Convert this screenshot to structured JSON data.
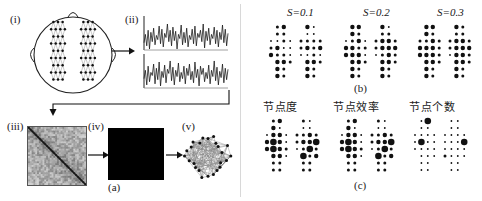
{
  "figure": {
    "panels": [
      {
        "id": "a",
        "label": "(a)"
      },
      {
        "id": "b",
        "label": "(b)"
      },
      {
        "id": "c",
        "label": "(c)"
      }
    ]
  },
  "panel_a": {
    "label": "(a)",
    "steps": [
      {
        "id": "i",
        "label": "(i)",
        "name": "electrode-montage-head"
      },
      {
        "id": "ii",
        "label": "(ii)",
        "name": "eeg-time-series"
      },
      {
        "id": "iii",
        "label": "(iii)",
        "name": "correlation-matrix"
      },
      {
        "id": "iv",
        "label": "(iv)",
        "name": "binary-adjacency-matrix"
      },
      {
        "id": "v",
        "label": "(v)",
        "name": "brain-network-graph"
      }
    ],
    "head": {
      "electrode_count_per_hemisphere": 31,
      "hemispheres": [
        "left",
        "right"
      ]
    },
    "time_series": {
      "trace_count": 2,
      "traces": [
        {
          "name": "channel-trace-1",
          "points": [
            42,
            58,
            36,
            66,
            30,
            62,
            44,
            70,
            38,
            56,
            48,
            74,
            40,
            68,
            34,
            60,
            52,
            78,
            44,
            66,
            36,
            72,
            46,
            64,
            30,
            58,
            50,
            76,
            38,
            62,
            42,
            70,
            34,
            56,
            48,
            68,
            40,
            74,
            36,
            60,
            52,
            66,
            44,
            78,
            32,
            64,
            46,
            70,
            38,
            58,
            50,
            72,
            40,
            66,
            34,
            62,
            48,
            76,
            42,
            68,
            36,
            60
          ]
        },
        {
          "name": "channel-trace-2",
          "points": [
            46,
            62,
            34,
            70,
            40,
            58,
            52,
            74,
            36,
            66,
            44,
            78,
            32,
            60,
            48,
            72,
            38,
            64,
            56,
            80,
            42,
            68,
            34,
            62,
            50,
            76,
            40,
            58,
            46,
            70,
            36,
            66,
            52,
            74,
            44,
            60,
            38,
            78,
            48,
            64,
            32,
            70,
            54,
            66,
            40,
            58,
            46,
            72,
            36,
            62,
            50,
            80,
            42,
            68,
            34,
            60,
            48,
            74,
            38,
            66,
            44,
            64
          ]
        }
      ]
    },
    "matrix": {
      "size": 32,
      "diagonal": "dark"
    },
    "network": {
      "node_count": 24,
      "edge_density": "dense"
    }
  },
  "panel_b": {
    "label": "(b)",
    "maps": [
      {
        "name": "sparsity-map-1",
        "title": "S=0.1",
        "sparsity": 0.1
      },
      {
        "name": "sparsity-map-2",
        "title": "S=0.2",
        "sparsity": 0.2
      },
      {
        "name": "sparsity-map-3",
        "title": "S=0.3",
        "sparsity": 0.3
      }
    ],
    "title_prefix": "S",
    "grid": {
      "rows": 8,
      "cols_per_lobe": 4,
      "lobes": 2
    }
  },
  "panel_c": {
    "label": "(c)",
    "maps": [
      {
        "name": "node-degree-map",
        "title": "节点度",
        "metric": "node degree"
      },
      {
        "name": "node-efficiency-map",
        "title": "节点效率",
        "metric": "node efficiency"
      },
      {
        "name": "node-count-map",
        "title": "节点个数",
        "metric": "node count"
      }
    ]
  },
  "dot_maps": {
    "b1": {
      "left": [
        [
          0,
          2,
          3,
          0
        ],
        [
          0,
          2,
          2,
          0
        ],
        [
          1,
          1,
          2,
          1
        ],
        [
          2,
          3,
          1,
          1
        ],
        [
          3,
          2,
          2,
          1
        ],
        [
          0,
          3,
          3,
          2
        ],
        [
          0,
          3,
          2,
          0
        ],
        [
          0,
          3,
          2,
          0
        ]
      ],
      "right": [
        [
          0,
          3,
          1,
          0
        ],
        [
          0,
          1,
          1,
          0
        ],
        [
          2,
          2,
          2,
          2
        ],
        [
          2,
          3,
          2,
          3
        ],
        [
          1,
          1,
          2,
          1
        ],
        [
          0,
          3,
          3,
          2
        ],
        [
          0,
          3,
          2,
          0
        ],
        [
          0,
          3,
          2,
          0
        ]
      ]
    },
    "b2": {
      "left": [
        [
          0,
          3,
          3,
          0
        ],
        [
          0,
          3,
          2,
          0
        ],
        [
          1,
          2,
          3,
          1
        ],
        [
          3,
          3,
          2,
          2
        ],
        [
          3,
          3,
          3,
          1
        ],
        [
          0,
          3,
          3,
          2
        ],
        [
          0,
          3,
          2,
          0
        ],
        [
          0,
          3,
          2,
          0
        ]
      ],
      "right": [
        [
          0,
          3,
          1,
          0
        ],
        [
          0,
          2,
          2,
          0
        ],
        [
          2,
          3,
          3,
          2
        ],
        [
          2,
          3,
          3,
          3
        ],
        [
          1,
          2,
          3,
          2
        ],
        [
          0,
          3,
          3,
          2
        ],
        [
          0,
          3,
          2,
          0
        ],
        [
          0,
          3,
          2,
          0
        ]
      ]
    },
    "b3": {
      "left": [
        [
          0,
          3,
          3,
          0
        ],
        [
          0,
          3,
          2,
          0
        ],
        [
          2,
          2,
          3,
          2
        ],
        [
          3,
          3,
          3,
          2
        ],
        [
          3,
          3,
          3,
          2
        ],
        [
          0,
          3,
          3,
          2
        ],
        [
          0,
          3,
          2,
          0
        ],
        [
          0,
          3,
          2,
          0
        ]
      ],
      "right": [
        [
          0,
          3,
          2,
          0
        ],
        [
          0,
          2,
          2,
          0
        ],
        [
          2,
          3,
          3,
          2
        ],
        [
          2,
          3,
          3,
          3
        ],
        [
          1,
          3,
          3,
          2
        ],
        [
          0,
          3,
          3,
          2
        ],
        [
          0,
          3,
          2,
          0
        ],
        [
          0,
          3,
          2,
          0
        ]
      ]
    },
    "c1": {
      "left": [
        [
          0,
          2,
          3,
          0
        ],
        [
          0,
          3,
          1,
          0
        ],
        [
          1,
          3,
          3,
          1
        ],
        [
          3,
          4,
          3,
          1
        ],
        [
          3,
          4,
          3,
          2
        ],
        [
          0,
          3,
          3,
          1
        ],
        [
          0,
          2,
          2,
          0
        ],
        [
          0,
          2,
          2,
          0
        ]
      ],
      "right": [
        [
          0,
          2,
          1,
          0
        ],
        [
          0,
          1,
          1,
          0
        ],
        [
          2,
          2,
          3,
          2
        ],
        [
          2,
          3,
          3,
          4
        ],
        [
          1,
          2,
          4,
          2
        ],
        [
          0,
          4,
          2,
          3
        ],
        [
          0,
          2,
          2,
          0
        ],
        [
          0,
          2,
          2,
          0
        ]
      ]
    },
    "c2": {
      "left": [
        [
          0,
          2,
          3,
          0
        ],
        [
          0,
          3,
          1,
          0
        ],
        [
          1,
          3,
          3,
          1
        ],
        [
          3,
          4,
          3,
          1
        ],
        [
          3,
          4,
          3,
          2
        ],
        [
          0,
          3,
          3,
          1
        ],
        [
          0,
          2,
          2,
          0
        ],
        [
          0,
          2,
          2,
          0
        ]
      ],
      "right": [
        [
          0,
          2,
          1,
          0
        ],
        [
          0,
          1,
          1,
          0
        ],
        [
          2,
          2,
          3,
          2
        ],
        [
          2,
          3,
          3,
          4
        ],
        [
          1,
          2,
          4,
          2
        ],
        [
          0,
          4,
          2,
          3
        ],
        [
          0,
          2,
          2,
          0
        ],
        [
          0,
          2,
          2,
          0
        ]
      ]
    },
    "c3": {
      "left": [
        [
          0,
          1,
          4,
          0
        ],
        [
          0,
          1,
          1,
          0
        ],
        [
          1,
          1,
          1,
          1
        ],
        [
          1,
          4,
          1,
          1
        ],
        [
          1,
          1,
          1,
          1
        ],
        [
          0,
          1,
          1,
          1
        ],
        [
          0,
          1,
          1,
          0
        ],
        [
          0,
          1,
          1,
          0
        ]
      ],
      "right": [
        [
          0,
          1,
          1,
          0
        ],
        [
          0,
          1,
          1,
          0
        ],
        [
          1,
          1,
          1,
          1
        ],
        [
          1,
          1,
          1,
          4
        ],
        [
          1,
          1,
          1,
          1
        ],
        [
          2,
          1,
          1,
          1
        ],
        [
          0,
          1,
          1,
          0
        ],
        [
          0,
          1,
          1,
          0
        ]
      ]
    }
  }
}
